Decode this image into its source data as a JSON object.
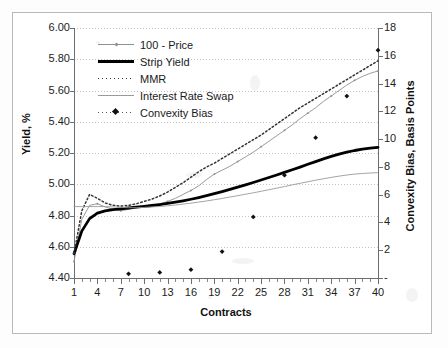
{
  "page": {
    "top_cut_text": ""
  },
  "axes": {
    "x_title": "Contracts",
    "y_left_title": "Yield, %",
    "y_right_title": "Convexity Bias, Basis Points"
  },
  "legend": {
    "items": [
      {
        "label": "100 - Price",
        "key": "line-thin-marker",
        "color": "#8f8f8f"
      },
      {
        "label": "Strip Yield",
        "key": "line-thick",
        "color": "#000000"
      },
      {
        "label": "MMR",
        "key": "line-dotted",
        "color": "#333333"
      },
      {
        "label": "Interest Rate Swap",
        "key": "line-thin",
        "color": "#9a9a9a"
      },
      {
        "label": "Convexity Bias",
        "key": "dotted-marker",
        "color": "#111111"
      }
    ]
  },
  "chart_data": {
    "type": "line",
    "title": "",
    "subtitle": "",
    "xlabel": "Contracts",
    "ylabel": "Yield, %",
    "y2label": "Convexity Bias, Basis Points",
    "xlim": [
      1,
      40
    ],
    "ylim": [
      4.4,
      6.0
    ],
    "y2lim": [
      0,
      18
    ],
    "grid": true,
    "legend_position": "top-left-inside",
    "xticks": [
      1,
      4,
      7,
      10,
      13,
      16,
      19,
      22,
      25,
      28,
      31,
      34,
      37,
      40
    ],
    "xtick_labels": [
      "1",
      "4",
      "7",
      "10",
      "13",
      "16",
      "19",
      "22",
      "25",
      "28",
      "31",
      "34",
      "37",
      "40"
    ],
    "xtick_minor_step": 1,
    "yticks": [
      4.4,
      4.6,
      4.8,
      5.0,
      5.2,
      5.4,
      5.6,
      5.8,
      6.0
    ],
    "ytick_labels": [
      "4.40",
      "4.60",
      "4.80",
      "5.00",
      "5.20",
      "5.40",
      "5.60",
      "5.80",
      "6.00"
    ],
    "y2ticks": [
      0,
      2,
      4,
      6,
      8,
      10,
      12,
      14,
      16,
      18
    ],
    "y2tick_labels": [
      "-",
      "2",
      "4",
      "6",
      "8",
      "10",
      "12",
      "14",
      "16",
      "18"
    ],
    "series": [
      {
        "name": "100 - Price",
        "axis": "left",
        "style": "thin-line-with-markers",
        "color": "#8f8f8f",
        "x": [
          1,
          2,
          3,
          4,
          5,
          6,
          7,
          8,
          9,
          10,
          11,
          12,
          13,
          14,
          15,
          16,
          17,
          18,
          19,
          20,
          21,
          22,
          23,
          24,
          25,
          26,
          27,
          28,
          29,
          30,
          31,
          32,
          33,
          34,
          35,
          36,
          37,
          38,
          39,
          40
        ],
        "values": [
          4.505,
          4.775,
          4.865,
          4.875,
          4.855,
          4.84,
          4.83,
          4.84,
          4.85,
          4.86,
          4.865,
          4.875,
          4.89,
          4.91,
          4.935,
          4.96,
          4.99,
          5.03,
          5.065,
          5.09,
          5.115,
          5.145,
          5.175,
          5.205,
          5.24,
          5.275,
          5.31,
          5.345,
          5.38,
          5.42,
          5.455,
          5.49,
          5.53,
          5.565,
          5.6,
          5.635,
          5.665,
          5.69,
          5.71,
          5.725
        ]
      },
      {
        "name": "Strip Yield",
        "axis": "left",
        "style": "thick-line",
        "color": "#000000",
        "x": [
          1,
          2,
          3,
          4,
          5,
          6,
          7,
          8,
          9,
          10,
          11,
          12,
          13,
          14,
          15,
          16,
          17,
          18,
          19,
          20,
          21,
          22,
          23,
          24,
          25,
          26,
          27,
          28,
          29,
          30,
          31,
          32,
          33,
          34,
          35,
          36,
          37,
          38,
          39,
          40
        ],
        "values": [
          4.555,
          4.7,
          4.78,
          4.815,
          4.83,
          4.838,
          4.843,
          4.848,
          4.853,
          4.858,
          4.864,
          4.87,
          4.877,
          4.885,
          4.894,
          4.904,
          4.915,
          4.927,
          4.94,
          4.953,
          4.967,
          4.981,
          4.996,
          5.011,
          5.027,
          5.043,
          5.059,
          5.076,
          5.093,
          5.11,
          5.128,
          5.145,
          5.162,
          5.178,
          5.193,
          5.205,
          5.216,
          5.225,
          5.231,
          5.236
        ]
      },
      {
        "name": "MMR",
        "axis": "left",
        "style": "dotted-line",
        "color": "#333333",
        "x": [
          1,
          2,
          3,
          4,
          5,
          6,
          7,
          8,
          9,
          10,
          11,
          12,
          13,
          14,
          15,
          16,
          17,
          18,
          19,
          20,
          21,
          22,
          23,
          24,
          25,
          26,
          27,
          28,
          29,
          30,
          31,
          32,
          33,
          34,
          35,
          36,
          37,
          38,
          39,
          40
        ],
        "values": [
          4.555,
          4.83,
          4.935,
          4.91,
          4.88,
          4.865,
          4.86,
          4.865,
          4.875,
          4.89,
          4.905,
          4.925,
          4.95,
          4.98,
          5.01,
          5.045,
          5.08,
          5.11,
          5.135,
          5.165,
          5.195,
          5.225,
          5.255,
          5.285,
          5.315,
          5.35,
          5.385,
          5.42,
          5.455,
          5.49,
          5.52,
          5.55,
          5.58,
          5.61,
          5.64,
          5.67,
          5.7,
          5.73,
          5.76,
          5.79
        ]
      },
      {
        "name": "Interest Rate Swap",
        "axis": "left",
        "style": "thin-line",
        "color": "#9a9a9a",
        "x": [
          1,
          2,
          3,
          4,
          5,
          6,
          7,
          8,
          9,
          10,
          11,
          12,
          13,
          14,
          15,
          16,
          17,
          18,
          19,
          20,
          21,
          22,
          23,
          24,
          25,
          26,
          27,
          28,
          29,
          30,
          31,
          32,
          33,
          34,
          35,
          36,
          37,
          38,
          39,
          40
        ],
        "values": [
          4.857,
          4.857,
          4.857,
          4.857,
          4.857,
          4.855,
          4.852,
          4.85,
          4.85,
          4.852,
          4.855,
          4.858,
          4.862,
          4.867,
          4.873,
          4.879,
          4.886,
          4.893,
          4.901,
          4.909,
          4.918,
          4.927,
          4.936,
          4.945,
          4.955,
          4.965,
          4.975,
          4.985,
          4.996,
          5.006,
          5.016,
          5.026,
          5.035,
          5.044,
          5.052,
          5.059,
          5.065,
          5.069,
          5.072,
          5.074
        ]
      },
      {
        "name": "Convexity Bias",
        "axis": "right",
        "style": "scatter-diamond",
        "color": "#111111",
        "x": [
          8,
          12,
          16,
          20,
          24,
          28,
          32,
          36,
          40
        ],
        "values": [
          0.3,
          0.4,
          0.6,
          1.9,
          4.4,
          7.4,
          10.1,
          13.1,
          16.4
        ]
      }
    ]
  }
}
